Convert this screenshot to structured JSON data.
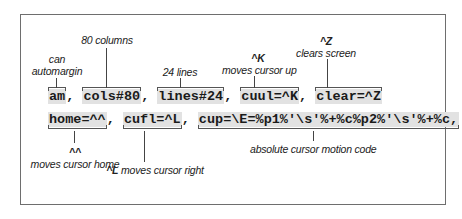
{
  "row1": {
    "items": [
      {
        "code": "am",
        "sep": ", "
      },
      {
        "code": "cols#80",
        "sep": ", "
      },
      {
        "code": "lines#24",
        "sep": ", "
      },
      {
        "code": "cuul=^K",
        "sep": ", "
      },
      {
        "code": "clear=^Z",
        "sep": ""
      }
    ]
  },
  "row2": {
    "items": [
      {
        "code": "home=^^",
        "sep": ", "
      },
      {
        "code": "cufl=^L",
        "sep": ", "
      },
      {
        "code": "cup=\\E=%p1%'\\s'%+%c%p2%'\\s'%+%c,",
        "sep": ""
      }
    ]
  },
  "annotations": {
    "am": {
      "line1": "can",
      "line2": "automargin"
    },
    "cols": {
      "text": "80 columns"
    },
    "lines": {
      "text": "24 lines"
    },
    "cuul": {
      "key": "^K",
      "text": "moves cursor up"
    },
    "clear": {
      "key": "^Z",
      "text": "clears screen"
    },
    "home": {
      "key": "^^",
      "text": "moves cursor home"
    },
    "cufl": {
      "key": "^L",
      "text": "moves cursor right"
    },
    "cup": {
      "text": "absolute cursor motion code"
    }
  },
  "colors": {
    "highlight": "#e2e2e2",
    "border": "#6e6e6e",
    "text": "#1a1a1a"
  }
}
